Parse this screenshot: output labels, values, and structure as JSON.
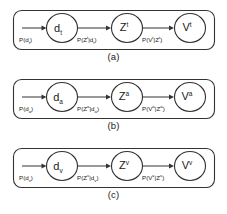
{
  "figure": {
    "type": "diagram",
    "background_color": "#ffffff",
    "stroke_color": "#333333",
    "text_color": "#1a1a1a"
  },
  "panels": [
    {
      "id": "a",
      "caption": "(a)",
      "modality": "t",
      "nodes": [
        {
          "name": "node-d",
          "base": "d",
          "sub": "t",
          "sup": ""
        },
        {
          "name": "node-z",
          "base": "Z",
          "sub": "",
          "sup": "t"
        },
        {
          "name": "node-v",
          "base": "V",
          "sub": "",
          "sup": "t"
        }
      ],
      "edges": [
        {
          "name": "edge-prior",
          "label": "P(d",
          "label_sub": "t",
          "label_end": ")"
        },
        {
          "name": "edge-d-to-z",
          "label": "P(Z",
          "label_sup": "t",
          "label_mid": "|d",
          "label_sub": "t",
          "label_end": ")"
        },
        {
          "name": "edge-z-to-v",
          "label": "P(V",
          "label_sup": "t",
          "label_mid": "|Z",
          "label_sup2": "t",
          "label_end": ")"
        }
      ]
    },
    {
      "id": "b",
      "caption": "(b)",
      "modality": "a",
      "nodes": [
        {
          "name": "node-d",
          "base": "d",
          "sub": "a",
          "sup": ""
        },
        {
          "name": "node-z",
          "base": "Z",
          "sub": "",
          "sup": "a"
        },
        {
          "name": "node-v",
          "base": "V",
          "sub": "",
          "sup": "a"
        }
      ],
      "edges": [
        {
          "name": "edge-prior",
          "label": "P(d",
          "label_sub": "a",
          "label_end": ")"
        },
        {
          "name": "edge-d-to-z",
          "label": "P(Z",
          "label_sup": "a",
          "label_mid": "|d",
          "label_sub": "a",
          "label_end": ")"
        },
        {
          "name": "edge-z-to-v",
          "label": "P(V",
          "label_sup": "a",
          "label_mid": "|Z",
          "label_sup2": "a",
          "label_end": ")"
        }
      ]
    },
    {
      "id": "c",
      "caption": "(c)",
      "modality": "v",
      "nodes": [
        {
          "name": "node-d",
          "base": "d",
          "sub": "v",
          "sup": ""
        },
        {
          "name": "node-z",
          "base": "Z",
          "sub": "",
          "sup": "v"
        },
        {
          "name": "node-v",
          "base": "V",
          "sub": "",
          "sup": "v"
        }
      ],
      "edges": [
        {
          "name": "edge-prior",
          "label": "P(d",
          "label_sub": "v",
          "label_end": ")"
        },
        {
          "name": "edge-d-to-z",
          "label": "P(Z",
          "label_sup": "v",
          "label_mid": "|d",
          "label_sub": "v",
          "label_end": ")"
        },
        {
          "name": "edge-z-to-v",
          "label": "P(V",
          "label_sup": "v",
          "label_mid": "|Z",
          "label_sup2": "v",
          "label_end": ")"
        }
      ]
    }
  ]
}
